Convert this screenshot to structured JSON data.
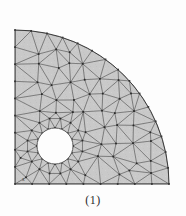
{
  "figure": {
    "caption": "(1)",
    "axis_label_x": "x",
    "kind": "finite-element-triangular-mesh"
  },
  "colors": {
    "background": "#fdfdfd",
    "element_fill": "#c9c9c9",
    "edge_stroke": "#5a5a5a",
    "boundary_stroke": "#3b3b3b",
    "node_fill": "#2a2a2a",
    "hole_fill": "#fdfdfd",
    "caption_text": "#2b2b2b"
  },
  "geometry": {
    "origin": {
      "x": 15,
      "y": 184
    },
    "outer_radius": 154,
    "hole": {
      "cx": 55,
      "cy": 146,
      "r": 18
    },
    "quarter_arc_start_deg": 0,
    "quarter_arc_end_deg": 90
  },
  "chart_data": {
    "type": "mesh",
    "title": "(1)",
    "xlabel": "x",
    "ylabel": "",
    "node_count": 118,
    "element_count": 196,
    "nodes": [
      [
        15,
        184
      ],
      [
        15,
        162
      ],
      [
        15,
        140
      ],
      [
        15,
        118
      ],
      [
        15,
        96
      ],
      [
        15,
        74
      ],
      [
        15,
        52
      ],
      [
        15,
        28
      ],
      [
        15,
        22
      ],
      [
        37,
        184
      ],
      [
        59,
        184
      ],
      [
        81,
        184
      ],
      [
        103,
        184
      ],
      [
        125,
        184
      ],
      [
        147,
        184
      ],
      [
        163,
        184
      ],
      [
        168,
        184
      ],
      [
        22,
        24
      ],
      [
        31,
        28
      ],
      [
        42,
        33
      ],
      [
        54,
        40
      ],
      [
        66,
        49
      ],
      [
        78,
        59
      ],
      [
        90,
        71
      ],
      [
        101,
        85
      ],
      [
        111,
        100
      ],
      [
        120,
        116
      ],
      [
        128,
        133
      ],
      [
        134,
        151
      ],
      [
        138,
        169
      ],
      [
        37,
        146
      ],
      [
        44,
        131
      ],
      [
        59,
        128
      ],
      [
        73,
        133
      ],
      [
        76,
        146
      ],
      [
        73,
        160
      ],
      [
        59,
        164
      ],
      [
        44,
        161
      ],
      [
        35,
        133
      ],
      [
        35,
        159
      ],
      [
        15,
        50
      ],
      [
        30,
        50
      ],
      [
        46,
        52
      ],
      [
        62,
        57
      ],
      [
        77,
        66
      ],
      [
        90,
        78
      ],
      [
        100,
        92
      ],
      [
        109,
        108
      ],
      [
        30,
        70
      ],
      [
        45,
        71
      ],
      [
        60,
        76
      ],
      [
        74,
        85
      ],
      [
        87,
        96
      ],
      [
        97,
        110
      ],
      [
        105,
        125
      ],
      [
        30,
        91
      ],
      [
        45,
        92
      ],
      [
        60,
        96
      ],
      [
        73,
        104
      ],
      [
        85,
        115
      ],
      [
        94,
        128
      ],
      [
        101,
        143
      ],
      [
        29,
        112
      ],
      [
        44,
        112
      ],
      [
        58,
        113
      ],
      [
        71,
        120
      ],
      [
        82,
        131
      ],
      [
        91,
        145
      ],
      [
        97,
        160
      ],
      [
        28,
        133
      ],
      [
        88,
        160
      ],
      [
        93,
        172
      ],
      [
        29,
        160
      ],
      [
        70,
        172
      ],
      [
        83,
        174
      ],
      [
        22,
        171
      ],
      [
        49,
        172
      ],
      [
        60,
        172
      ],
      [
        36,
        172
      ],
      [
        15,
        40
      ],
      [
        24,
        40
      ],
      [
        38,
        42
      ],
      [
        52,
        46
      ],
      [
        67,
        53
      ],
      [
        80,
        62
      ],
      [
        22,
        35
      ],
      [
        33,
        36
      ],
      [
        46,
        40
      ],
      [
        58,
        46
      ],
      [
        71,
        55
      ],
      [
        15,
        62
      ],
      [
        24,
        60
      ],
      [
        39,
        61
      ],
      [
        54,
        65
      ],
      [
        68,
        73
      ],
      [
        82,
        84
      ],
      [
        94,
        99
      ],
      [
        103,
        116
      ],
      [
        15,
        85
      ],
      [
        23,
        82
      ],
      [
        38,
        82
      ],
      [
        53,
        86
      ],
      [
        67,
        94
      ],
      [
        80,
        105
      ],
      [
        91,
        118
      ],
      [
        99,
        133
      ],
      [
        15,
        107
      ],
      [
        23,
        102
      ],
      [
        37,
        102
      ],
      [
        52,
        104
      ],
      [
        66,
        111
      ],
      [
        78,
        124
      ],
      [
        88,
        136
      ],
      [
        95,
        151
      ],
      [
        15,
        129
      ],
      [
        23,
        122
      ],
      [
        106,
        140
      ],
      [
        112,
        128
      ],
      [
        117,
        143
      ],
      [
        122,
        157
      ],
      [
        126,
        170
      ],
      [
        109,
        155
      ],
      [
        114,
        168
      ],
      [
        101,
        168
      ],
      [
        104,
        178
      ],
      [
        91,
        178
      ],
      [
        78,
        178
      ],
      [
        66,
        178
      ],
      [
        52,
        178
      ],
      [
        40,
        178
      ],
      [
        28,
        178
      ]
    ],
    "legend": [],
    "grid": false
  }
}
